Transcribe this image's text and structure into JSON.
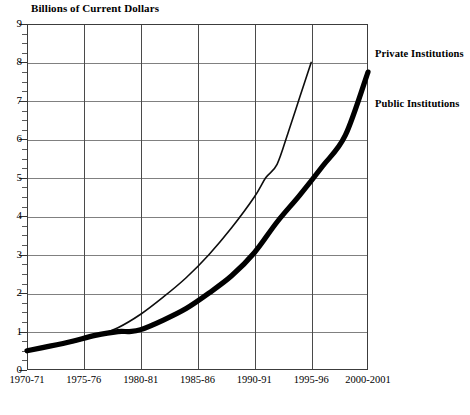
{
  "chart_data": {
    "type": "line",
    "title": "Billions of Current Dollars",
    "xlabel": "",
    "ylabel": "",
    "ylim": [
      0,
      9
    ],
    "y_ticks": [
      0,
      1,
      2,
      3,
      4,
      5,
      6,
      7,
      8,
      9
    ],
    "grid": true,
    "legend_position": "right-of-plot",
    "categories": [
      "1970-71",
      "1975-76",
      "1980-81",
      "1985-86",
      "1990-91",
      "1995-96",
      "2000-2001"
    ],
    "x": [
      1970,
      1975,
      1980,
      1985,
      1990,
      1995,
      2000
    ],
    "series": [
      {
        "name": "Private Institutions",
        "style": "thin",
        "x": [
          1970,
          1972,
          1974,
          1976,
          1978,
          1980,
          1982,
          1984,
          1986,
          1988,
          1990,
          1991,
          1992,
          1993,
          1994,
          1995
        ],
        "values": [
          0.5,
          0.6,
          0.72,
          0.88,
          1.1,
          1.45,
          1.9,
          2.4,
          3.0,
          3.7,
          4.5,
          5.0,
          5.35,
          6.2,
          7.1,
          8.0
        ]
      },
      {
        "name": "Public Institutions",
        "style": "thick",
        "x": [
          1970,
          1972,
          1974,
          1976,
          1978,
          1979,
          1980,
          1982,
          1984,
          1986,
          1988,
          1990,
          1992,
          1994,
          1996,
          1998,
          2000
        ],
        "values": [
          0.5,
          0.62,
          0.75,
          0.9,
          1.0,
          1.0,
          1.05,
          1.3,
          1.6,
          2.0,
          2.45,
          3.05,
          3.85,
          4.55,
          5.3,
          6.1,
          7.75
        ]
      }
    ],
    "annotations": [
      {
        "text": "Private Institutions",
        "at": "right of 1995-96 endpoint"
      },
      {
        "text": "Public Institutions",
        "at": "right of plot, below private label"
      }
    ]
  },
  "axis": {
    "y_labels": [
      "9",
      "8",
      "7",
      "6",
      "5",
      "4",
      "3",
      "2",
      "1",
      "0"
    ],
    "x_labels": [
      "1970-71",
      "1975-76",
      "1980-81",
      "1985-86",
      "1990-91",
      "1995-96",
      "2000-2001"
    ]
  },
  "legend": {
    "private_label": "Private Institutions",
    "public_label": "Public Institutions"
  },
  "colors": {
    "line": "#000000",
    "grid": "#808080",
    "frame": "#3c3c3c",
    "background": "#ffffff"
  },
  "caption": {
    "clipped_text": ""
  }
}
